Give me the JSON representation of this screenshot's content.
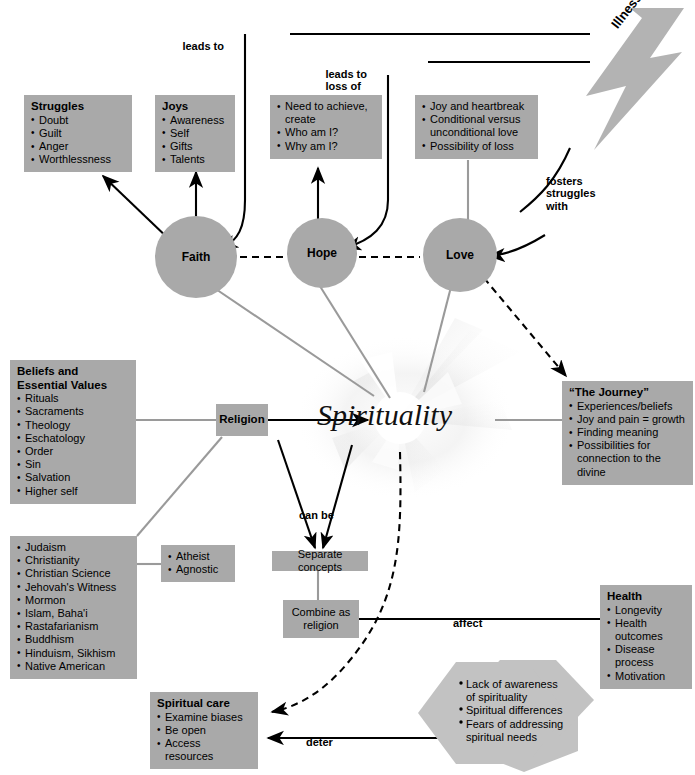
{
  "diagram": {
    "center_label": "Spirituality",
    "colors": {
      "box_fill": "#a9a9a9",
      "hex_fill": "#c2c2c2",
      "bolt_fill": "#b3b3b3",
      "line_black": "#000000",
      "line_gray": "#9a9a9a",
      "text": "#000000"
    }
  },
  "nodes": {
    "struggles": {
      "heading": "Struggles",
      "items": [
        "Doubt",
        "Guilt",
        "Anger",
        "Worthlessness"
      ]
    },
    "joys": {
      "heading": "Joys",
      "items": [
        "Awareness",
        "Self",
        "Gifts",
        "Talents"
      ]
    },
    "hope_attributes": {
      "heading": "",
      "items": [
        "Need to achieve,\ncreate",
        "Who am I?",
        "Why am I?"
      ]
    },
    "love_attributes": {
      "heading": "",
      "items": [
        "Joy and heartbreak",
        "Conditional versus\nunconditional love",
        "Possibility of loss"
      ]
    },
    "beliefs": {
      "heading": "Beliefs and\nEssential Values",
      "items": [
        "Rituals",
        "Sacraments",
        "Theology",
        "Eschatology",
        "Order",
        "Sin",
        "Salvation",
        "Higher self"
      ]
    },
    "religions": {
      "heading": "",
      "items": [
        "Judaism",
        "Christianity",
        "Christian Science",
        "Jehovah's Witness",
        "Mormon",
        "Islam, Baha'i",
        "Rastafarianism",
        "Buddhism",
        "Hinduism, Sikhism",
        "Native American"
      ]
    },
    "nonbelief": {
      "heading": "",
      "items": [
        "Atheist",
        "Agnostic"
      ]
    },
    "journey": {
      "heading": "“The Journey”",
      "items": [
        "Experiences/beliefs",
        "Joy and pain = growth",
        "Finding meaning",
        "Possibilities for\nconnection to the divine"
      ]
    },
    "health": {
      "heading": "Health",
      "items": [
        "Longevity",
        "Health outcomes",
        "Disease process",
        "Motivation"
      ]
    },
    "spiritual_care": {
      "heading": "Spiritual care",
      "items": [
        "Examine biases",
        "Be open",
        "Access resources"
      ]
    },
    "barriers": {
      "heading": "",
      "items": [
        "Lack of awareness\nof spirituality",
        "Spiritual differences",
        "Fears of addressing\nspiritual needs"
      ]
    },
    "religion": {
      "label": "Religion"
    },
    "separate_concepts": {
      "label": "Separate concepts"
    },
    "combine_as_religion": {
      "label": "Combine as\nreligion"
    },
    "illness": {
      "label": "Illness"
    }
  },
  "circles": {
    "faith": "Faith",
    "hope": "Hope",
    "love": "Love"
  },
  "edge_labels": {
    "leads_to": "leads to",
    "leads_to_loss_of": "leads to\nloss of",
    "fosters_struggles_with": "fosters\nstruggles\nwith",
    "can_be": "can be",
    "affect": "affect",
    "deter": "deter"
  }
}
